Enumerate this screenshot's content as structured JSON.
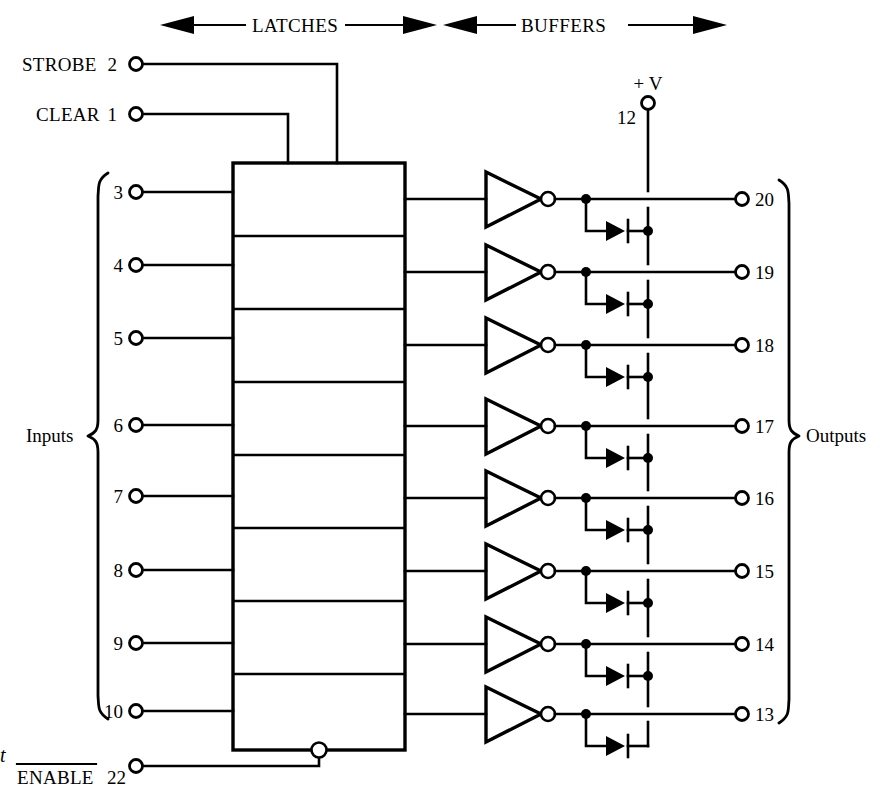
{
  "diagram": {
    "sections": [
      {
        "label": "LATCHES",
        "arrow": "double-headed"
      },
      {
        "label": "BUFFERS",
        "arrow": "double-headed"
      }
    ],
    "control_inputs": [
      {
        "label": "STROBE",
        "pin": "2"
      },
      {
        "label": "CLEAR",
        "pin": "1"
      }
    ],
    "enable_input": {
      "label": "ENABLE",
      "pin": "22",
      "active_low": true,
      "stray_text": "t"
    },
    "supply": {
      "label": "+ V",
      "pin": "12"
    },
    "groups": {
      "inputs_label": "Inputs",
      "outputs_label": "Outputs"
    },
    "input_pins": [
      "3",
      "4",
      "5",
      "6",
      "7",
      "8",
      "9",
      "10"
    ],
    "output_pins": [
      "20",
      "19",
      "18",
      "17",
      "16",
      "15",
      "14",
      "13"
    ],
    "latch_cells": 8,
    "buffer_type": "inverting-buffer",
    "diode_count": 8,
    "colors": {
      "line": "#000000",
      "background": "#ffffff"
    }
  }
}
